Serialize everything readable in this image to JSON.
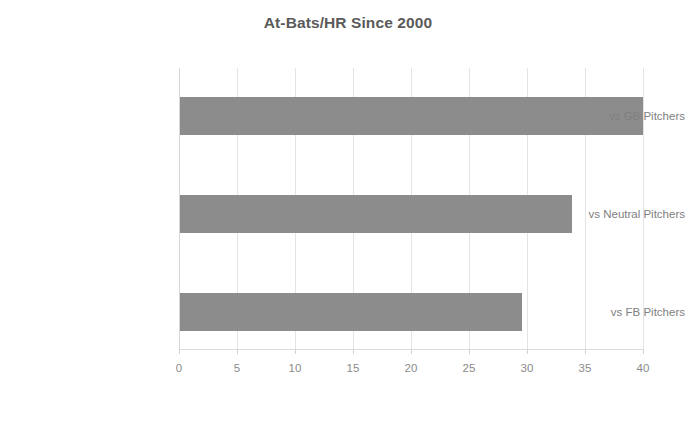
{
  "chart_data": {
    "type": "bar",
    "orientation": "horizontal",
    "title": "At-Bats/HR Since 2000",
    "xlabel": "",
    "ylabel": "",
    "categories": [
      "vs GB Pitchers",
      "vs Neutral Pitchers",
      "vs FB Pitchers"
    ],
    "values": [
      40.0,
      33.9,
      29.6
    ],
    "xlim": [
      0,
      40
    ],
    "xticks": [
      0,
      5,
      10,
      15,
      20,
      25,
      30,
      35,
      40
    ],
    "xtick_labels": [
      "0",
      "5",
      "10",
      "15",
      "20",
      "25",
      "30",
      "35",
      "40"
    ],
    "grid": "vertical",
    "legend": null,
    "bar_color": "#8c8c8c",
    "gridline_color": "#e4e4e4",
    "title_color": "#5a5a5a",
    "label_color": "#808080",
    "background": "#ffffff"
  }
}
